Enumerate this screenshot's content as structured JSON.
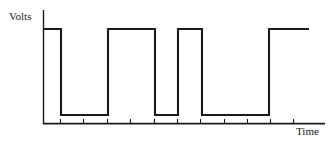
{
  "figure": {
    "type": "digital-waveform-plot",
    "background_color": "#ffffff",
    "line_color": "#1a1a1a"
  },
  "labels": {
    "y_axis": "Volts",
    "x_axis": "Time"
  },
  "chart_data": {
    "type": "line",
    "title": "",
    "xlabel": "Time",
    "ylabel": "Volts",
    "subtitle": "",
    "grid": false,
    "legend": null,
    "waveform_style": "square-wave-digital-signal",
    "levels": {
      "high": 1,
      "low": 0
    },
    "x_tick_count": 11,
    "x_tick_positions_px": [
      60,
      83,
      107,
      130,
      154,
      177,
      200,
      224,
      247,
      270,
      293
    ],
    "axis_px": {
      "y_axis_x": 43,
      "y_axis_top": 10,
      "x_axis_y": 124,
      "x_axis_left": 43,
      "x_axis_right": 325,
      "high_level_y": 29,
      "low_level_y": 115
    },
    "transitions": [
      {
        "x": 44,
        "level": 1
      },
      {
        "x": 61,
        "level": 0
      },
      {
        "x": 108,
        "level": 1
      },
      {
        "x": 155,
        "level": 0
      },
      {
        "x": 178,
        "level": 1
      },
      {
        "x": 202,
        "level": 0
      },
      {
        "x": 269,
        "level": 1
      },
      {
        "x": 309,
        "level": 1
      }
    ],
    "bit_sequence": [
      1,
      0,
      1,
      0,
      1,
      0,
      1
    ],
    "series": [
      {
        "name": "voltage",
        "x": [
          44,
          61,
          61,
          108,
          108,
          155,
          155,
          178,
          178,
          202,
          202,
          269,
          269,
          309
        ],
        "values": [
          1,
          1,
          0,
          0,
          1,
          1,
          0,
          0,
          1,
          1,
          0,
          0,
          1,
          1
        ]
      }
    ],
    "ylim": [
      0,
      1.15
    ],
    "xlim": [
      43,
      325
    ]
  }
}
